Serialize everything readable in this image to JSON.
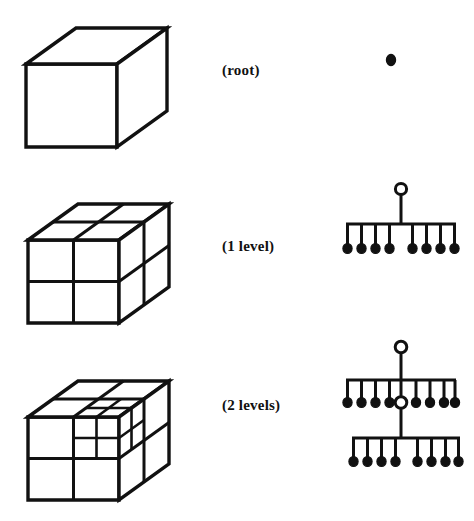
{
  "figure": {
    "title_fragment_top": "",
    "background_color": "#ffffff",
    "ink_color": "#111111",
    "rows": [
      {
        "id": "root",
        "label": "(root)",
        "cube_name": "cube-undivided",
        "tree_name": "tree-root-only",
        "subdivision": "1x1x1",
        "tree_nodes": {
          "internal": 0,
          "leaves": 1,
          "levels": 0
        }
      },
      {
        "id": "one-level",
        "label": "(1 level)",
        "cube_name": "cube-2x2x2",
        "tree_name": "tree-one-level",
        "subdivision": "2x2x2",
        "tree_nodes": {
          "internal": 1,
          "leaves": 8,
          "levels": 1
        }
      },
      {
        "id": "two-levels",
        "label": "(2 levels)",
        "cube_name": "cube-2x2x2-with-subdivided-octant",
        "tree_name": "tree-two-levels",
        "subdivision": "2x2x2 with one octant split again",
        "tree_nodes": {
          "internal": 2,
          "leaves": 15,
          "levels": 2
        }
      }
    ]
  }
}
